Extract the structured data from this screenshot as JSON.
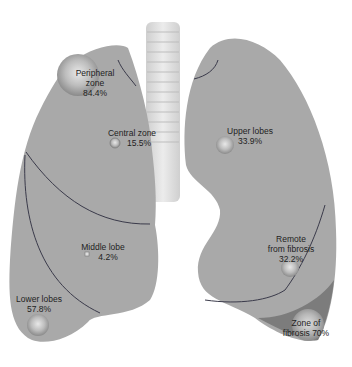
{
  "colors": {
    "lung": "#a9a9a9",
    "lung_dark": "#8a8a8a",
    "fibrosis": "#7c7c7c",
    "fissure": "#3a3a4a",
    "trachea": "#d8d8d8",
    "background": "#ffffff"
  },
  "regions": {
    "peripheral": {
      "name": "Peripheral zone",
      "line1": "Peripheral",
      "line2": "zone",
      "value": "84.4%"
    },
    "central": {
      "name": "Central zone",
      "value": "15.5%"
    },
    "upper": {
      "name": "Upper lobes",
      "value": "33.9%"
    },
    "middle": {
      "name": "Middle lobe",
      "value": "4.2%"
    },
    "lower": {
      "name": "Lower lobes",
      "value": "57.8%"
    },
    "remote": {
      "name": "Remote from fibrosis",
      "line1": "Remote",
      "line2": "from fibrosis",
      "value": "32.2%"
    },
    "fibrosis": {
      "name": "Zone of fibrosis",
      "line1": "Zone of",
      "line2": "fibrosis 70%"
    }
  }
}
